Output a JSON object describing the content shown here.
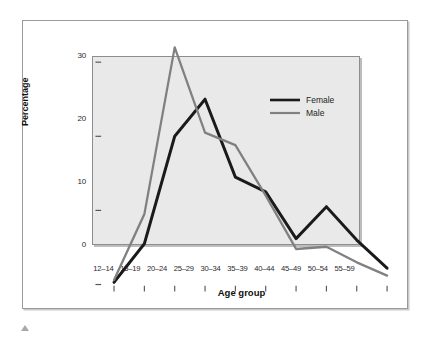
{
  "figure": {
    "background": "#ffffff",
    "plot_background": "#e9e9e9",
    "frame_color": "#9a9a9a"
  },
  "legend": {
    "position": "top-right-inside",
    "entries": [
      {
        "label": "Female",
        "color": "#1a1a1a",
        "width": 2.6
      },
      {
        "label": "Male",
        "color": "#808080",
        "width": 2.0
      }
    ]
  },
  "axes": {
    "y_title": "Percentage",
    "x_title": "Age group",
    "y_ticks": [
      "0",
      "10",
      "20",
      "30"
    ],
    "x_ticks": [
      "12–14",
      "15–19",
      "20–24",
      "25–29",
      "30–34",
      "35–39",
      "40–44",
      "45–49",
      "50–54",
      "55–59"
    ]
  },
  "marker": {
    "name": "caret-up-marker",
    "color": "#a8a8a8"
  },
  "chart_data": {
    "type": "line",
    "title": "",
    "subtitle": "",
    "xlabel": "Age group",
    "ylabel": "Percentage",
    "ylim": [
      0,
      30
    ],
    "yticks": [
      0,
      10,
      20,
      30
    ],
    "grid": false,
    "legend_position": "upper right",
    "categories": [
      "12–14",
      "15–19",
      "20–24",
      "25–29",
      "30–34",
      "35–39",
      "40–44",
      "45–49",
      "50–54",
      "55–59"
    ],
    "series": [
      {
        "name": "Female",
        "color": "#1a1a1a",
        "values": [
          0.3,
          5.5,
          20.0,
          25.0,
          14.5,
          12.5,
          6.2,
          10.5,
          6.0,
          2.2
        ]
      },
      {
        "name": "Male",
        "color": "#808080",
        "values": [
          0.6,
          9.5,
          32.0,
          20.5,
          18.8,
          12.0,
          4.8,
          5.1,
          3.0,
          1.2
        ]
      }
    ]
  }
}
